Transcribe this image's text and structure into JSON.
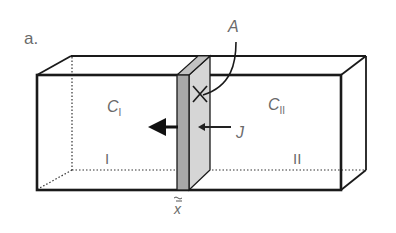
{
  "figure": {
    "panel_label": "a.",
    "labels": {
      "area": "A",
      "conc_left_main": "C",
      "conc_left_sub": "I",
      "conc_right_main": "C",
      "conc_right_sub": "II",
      "flux": "J",
      "region_left": "I",
      "region_right": "II",
      "position": "x",
      "position_mark": "~"
    },
    "colors": {
      "outline": "#1a1a1a",
      "membrane_front": "#a8a8a8",
      "membrane_side": "#d6d6d6",
      "text": "#6a6a6a"
    }
  }
}
